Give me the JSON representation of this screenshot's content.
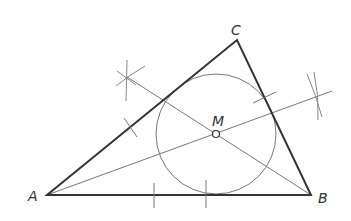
{
  "diagram": {
    "colors": {
      "thick_line": "#333333",
      "thin_line": "#777777",
      "label": "#333333",
      "background": "#ffffff"
    },
    "points": {
      "A": {
        "label": "A",
        "x": 47,
        "y": 195
      },
      "B": {
        "label": "B",
        "x": 311,
        "y": 195
      },
      "C": {
        "label": "C",
        "x": 237,
        "y": 40
      },
      "M": {
        "label": "M",
        "x": 216,
        "y": 134
      }
    },
    "labels": {
      "A": "A",
      "B": "B",
      "C": "C",
      "M": "M"
    },
    "circle": {
      "cx": 216,
      "cy": 134,
      "r": 60
    },
    "construction_lines": [
      {
        "name": "line-from-upper-left-arc-to-B",
        "x1": 127,
        "y1": 77,
        "x2": 311,
        "y2": 195
      },
      {
        "name": "line-from-A-to-right-arc",
        "x1": 47,
        "y1": 195,
        "x2": 332,
        "y2": 91
      }
    ]
  }
}
